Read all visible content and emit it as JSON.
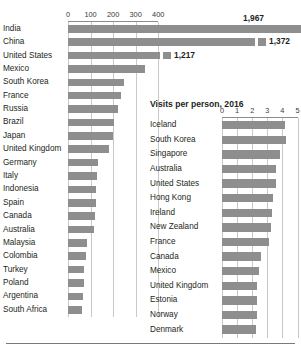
{
  "chart_data": [
    {
      "id": "arrivals",
      "type": "bar",
      "orientation": "horizontal",
      "title": "",
      "xlabel": "",
      "ylabel": "",
      "xlim": [
        0,
        440
      ],
      "ticks": [
        0,
        100,
        200,
        300,
        400
      ],
      "tick_labels": [
        "0",
        "100",
        "200",
        "300",
        "400"
      ],
      "grid": true,
      "legend": "none",
      "truncated_note": "Top three bars are truncated; actual values shown as labels",
      "categories": [
        "India",
        "China",
        "United States",
        "Mexico",
        "South Korea",
        "France",
        "Russia",
        "Brazil",
        "Japan",
        "United Kingdom",
        "Germany",
        "Italy",
        "Indonesia",
        "Spain",
        "Canada",
        "Australia",
        "Malaysia",
        "Colombia",
        "Turkey",
        "Poland",
        "Argentina",
        "South Africa"
      ],
      "values": [
        1967,
        1372,
        1217,
        340,
        248,
        237,
        222,
        205,
        201,
        183,
        132,
        128,
        126,
        122,
        120,
        115,
        85,
        78,
        72,
        70,
        66,
        60
      ],
      "value_labels": [
        "1,967",
        "1,372",
        "1,217",
        "",
        "",
        "",
        "",
        "",
        "",
        "",
        "",
        "",
        "",
        "",
        "",
        "",
        "",
        "",
        "",
        "",
        "",
        ""
      ],
      "truncated": [
        true,
        true,
        true,
        false,
        false,
        false,
        false,
        false,
        false,
        false,
        false,
        false,
        false,
        false,
        false,
        false,
        false,
        false,
        false,
        false,
        false,
        false
      ],
      "truncated_draw_to": [
        415,
        255,
        160
      ]
    },
    {
      "id": "visits",
      "type": "bar",
      "orientation": "horizontal",
      "title": "Visits per person, 2016",
      "xlabel": "",
      "ylabel": "",
      "xlim": [
        0,
        5.3
      ],
      "ticks": [
        0,
        1,
        2,
        3,
        4,
        5
      ],
      "tick_labels": [
        "0",
        "1",
        "2",
        "3",
        "4",
        "5"
      ],
      "grid": true,
      "legend": "none",
      "categories": [
        "Iceland",
        "South Korea",
        "Singapore",
        "Australia",
        "United States",
        "Hong Kong",
        "Ireland",
        "New Zealand",
        "France",
        "Canada",
        "Mexico",
        "United Kingdom",
        "Estonia",
        "Norway",
        "Denmark"
      ],
      "values": [
        4.15,
        4.25,
        3.85,
        3.55,
        3.55,
        3.35,
        3.3,
        3.25,
        3.1,
        2.6,
        2.45,
        2.35,
        2.3,
        2.3,
        2.25
      ]
    }
  ],
  "left_chart": {
    "name": "international-arrivals-chart"
  },
  "right_chart": {
    "name": "visits-per-person-chart"
  }
}
